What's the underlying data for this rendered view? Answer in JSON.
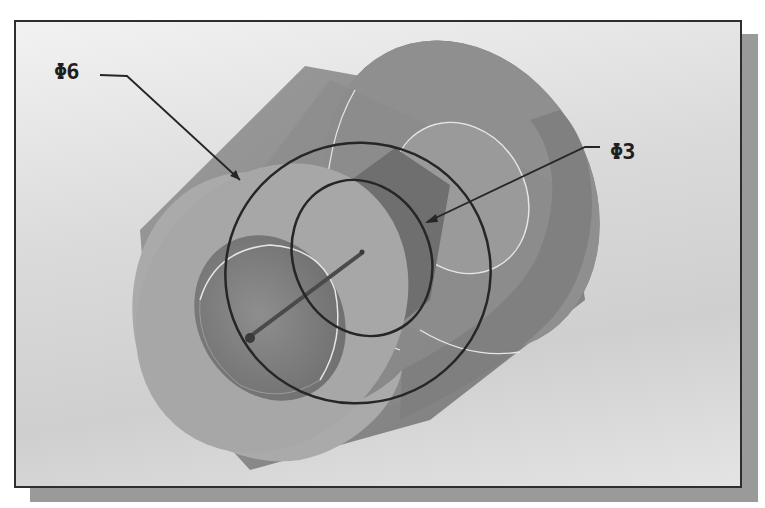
{
  "figure": {
    "type": "cad-isometric-hollow-cylinder",
    "colors": {
      "background_light": "#f2f2f2",
      "background_dark": "#cfcfcf",
      "frame_border": "#2e2e2e",
      "shadow": "#9a9a9a",
      "outer_face": "#a9a9a9",
      "body": "#8c8c8c",
      "bore": "#7a7a7a",
      "edge_highlight": "#e6e6e6",
      "dimension_line": "#262626"
    },
    "dimensions": [
      {
        "id": "outer-diameter",
        "label": "Φ6"
      },
      {
        "id": "inner-diameter",
        "label": "Φ3"
      }
    ]
  }
}
